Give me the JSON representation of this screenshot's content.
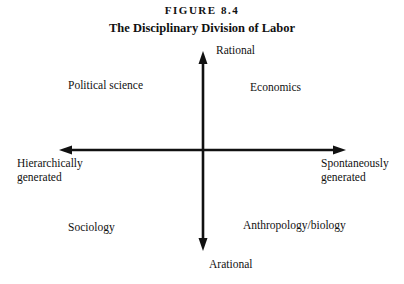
{
  "figure": {
    "label": "FIGURE 8.4",
    "title": "The Disciplinary Division of Labor"
  },
  "axes": {
    "vertical": {
      "top": "Rational",
      "bottom": "Arational"
    },
    "horizontal": {
      "left_line1": "Hierarchically",
      "left_line2": "generated",
      "right_line1": "Spontaneously",
      "right_line2": "generated"
    }
  },
  "quadrants": {
    "top_left": "Political science",
    "top_right": "Economics",
    "bottom_left": "Sociology",
    "bottom_right": "Anthropology/biology"
  },
  "colors": {
    "line": "#111111",
    "text": "#111111",
    "background": "#ffffff"
  }
}
